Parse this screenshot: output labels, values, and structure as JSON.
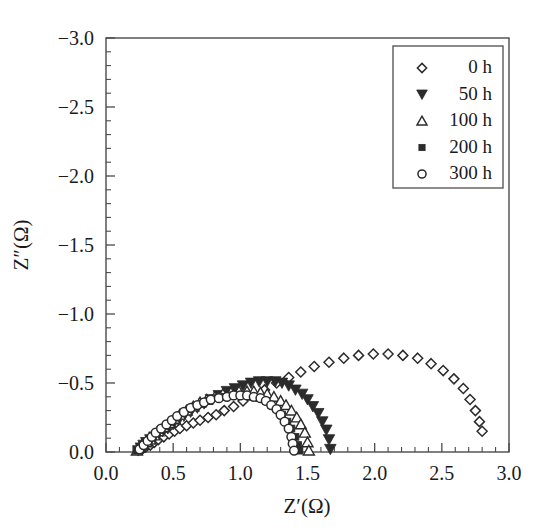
{
  "chart_data": {
    "type": "scatter",
    "title": "",
    "xlabel": "Z′(Ω)",
    "ylabel": "Z″(Ω)",
    "xlim": [
      0.0,
      3.0
    ],
    "ylim": [
      0.0,
      -3.0
    ],
    "x_ticks": [
      "0.0",
      "0.5",
      "1.0",
      "1.5",
      "2.0",
      "2.5",
      "3.0"
    ],
    "x_tick_values": [
      0.0,
      0.5,
      1.0,
      1.5,
      2.0,
      2.5,
      3.0
    ],
    "y_ticks": [
      "-3.0",
      "-2.5",
      "-2.0",
      "-1.5",
      "-1.0",
      "-0.5",
      "0.0"
    ],
    "y_tick_values": [
      -3.0,
      -2.5,
      -2.0,
      -1.5,
      -1.0,
      -0.5,
      0.0
    ],
    "minor_ticks_per_interval": 4,
    "grid": false,
    "legend_position": "top-right",
    "marker_color": "#2b2b2b",
    "series": [
      {
        "name": "0 h",
        "marker": "open-diamond",
        "x": [
          0.27,
          0.3,
          0.33,
          0.36,
          0.39,
          0.43,
          0.47,
          0.51,
          0.55,
          0.6,
          0.65,
          0.7,
          0.76,
          0.82,
          0.88,
          0.95,
          1.02,
          1.1,
          1.18,
          1.27,
          1.36,
          1.45,
          1.55,
          1.66,
          1.77,
          1.88,
          1.99,
          2.1,
          2.21,
          2.32,
          2.42,
          2.51,
          2.59,
          2.66,
          2.71,
          2.75,
          2.78,
          2.8
        ],
        "y": [
          -0.02,
          -0.04,
          -0.05,
          -0.07,
          -0.09,
          -0.11,
          -0.13,
          -0.15,
          -0.17,
          -0.19,
          -0.21,
          -0.23,
          -0.25,
          -0.27,
          -0.3,
          -0.33,
          -0.37,
          -0.41,
          -0.45,
          -0.5,
          -0.54,
          -0.58,
          -0.62,
          -0.65,
          -0.68,
          -0.7,
          -0.71,
          -0.71,
          -0.7,
          -0.68,
          -0.64,
          -0.59,
          -0.53,
          -0.46,
          -0.38,
          -0.3,
          -0.22,
          -0.15
        ]
      },
      {
        "name": "50 h",
        "marker": "filled-triangle-down",
        "x": [
          0.24,
          0.26,
          0.28,
          0.3,
          0.33,
          0.36,
          0.39,
          0.42,
          0.46,
          0.5,
          0.54,
          0.58,
          0.63,
          0.68,
          0.73,
          0.78,
          0.84,
          0.9,
          0.96,
          1.02,
          1.08,
          1.14,
          1.2,
          1.26,
          1.31,
          1.36,
          1.41,
          1.46,
          1.5,
          1.54,
          1.58,
          1.61,
          1.64,
          1.66,
          1.67
        ],
        "y": [
          -0.01,
          -0.03,
          -0.05,
          -0.07,
          -0.09,
          -0.11,
          -0.13,
          -0.15,
          -0.17,
          -0.2,
          -0.23,
          -0.26,
          -0.29,
          -0.32,
          -0.35,
          -0.38,
          -0.41,
          -0.44,
          -0.46,
          -0.48,
          -0.5,
          -0.51,
          -0.51,
          -0.51,
          -0.5,
          -0.48,
          -0.45,
          -0.42,
          -0.38,
          -0.33,
          -0.28,
          -0.22,
          -0.16,
          -0.09,
          -0.02
        ]
      },
      {
        "name": "100 h",
        "marker": "open-triangle-up",
        "x": [
          0.23,
          0.25,
          0.27,
          0.3,
          0.33,
          0.36,
          0.39,
          0.43,
          0.47,
          0.51,
          0.55,
          0.6,
          0.65,
          0.7,
          0.75,
          0.81,
          0.87,
          0.93,
          0.99,
          1.05,
          1.1,
          1.15,
          1.2,
          1.25,
          1.3,
          1.34,
          1.38,
          1.42,
          1.45,
          1.48,
          1.5,
          1.51
        ],
        "y": [
          -0.01,
          -0.03,
          -0.05,
          -0.07,
          -0.09,
          -0.12,
          -0.15,
          -0.18,
          -0.21,
          -0.24,
          -0.27,
          -0.3,
          -0.33,
          -0.36,
          -0.38,
          -0.4,
          -0.42,
          -0.43,
          -0.44,
          -0.44,
          -0.44,
          -0.43,
          -0.42,
          -0.4,
          -0.37,
          -0.34,
          -0.3,
          -0.25,
          -0.2,
          -0.14,
          -0.07,
          -0.01
        ]
      },
      {
        "name": "200 h",
        "marker": "filled-square",
        "x": [
          0.23,
          0.25,
          0.27,
          0.29,
          0.32,
          0.35,
          0.38,
          0.41,
          0.45,
          0.49,
          0.53,
          0.57,
          0.62,
          0.67,
          0.72,
          0.77,
          0.83,
          0.88,
          0.94,
          0.99,
          1.04,
          1.09,
          1.14,
          1.19,
          1.23,
          1.27,
          1.31,
          1.35,
          1.38,
          1.41,
          1.43,
          1.44
        ],
        "y": [
          -0.01,
          -0.03,
          -0.05,
          -0.07,
          -0.09,
          -0.11,
          -0.14,
          -0.16,
          -0.19,
          -0.22,
          -0.25,
          -0.28,
          -0.31,
          -0.33,
          -0.35,
          -0.37,
          -0.39,
          -0.4,
          -0.41,
          -0.41,
          -0.41,
          -0.4,
          -0.39,
          -0.37,
          -0.34,
          -0.31,
          -0.27,
          -0.22,
          -0.17,
          -0.11,
          -0.05,
          -0.01
        ]
      },
      {
        "name": "300 h",
        "marker": "open-circle",
        "x": [
          0.25,
          0.28,
          0.31,
          0.34,
          0.37,
          0.41,
          0.45,
          0.49,
          0.53,
          0.58,
          0.63,
          0.68,
          0.73,
          0.78,
          0.84,
          0.9,
          0.95,
          1.0,
          1.05,
          1.1,
          1.15,
          1.19,
          1.23,
          1.27,
          1.3,
          1.33,
          1.36,
          1.38,
          1.39,
          1.4
        ],
        "y": [
          -0.02,
          -0.05,
          -0.08,
          -0.11,
          -0.14,
          -0.17,
          -0.2,
          -0.23,
          -0.26,
          -0.29,
          -0.32,
          -0.34,
          -0.36,
          -0.38,
          -0.39,
          -0.4,
          -0.41,
          -0.41,
          -0.41,
          -0.4,
          -0.39,
          -0.37,
          -0.34,
          -0.31,
          -0.27,
          -0.22,
          -0.17,
          -0.11,
          -0.06,
          -0.01
        ]
      }
    ]
  },
  "legend": {
    "items": [
      {
        "label": "0 h",
        "marker": "open-diamond"
      },
      {
        "label": "50 h",
        "marker": "filled-triangle-down"
      },
      {
        "label": "100 h",
        "marker": "open-triangle-up"
      },
      {
        "label": "200 h",
        "marker": "filled-square"
      },
      {
        "label": "300 h",
        "marker": "open-circle"
      }
    ]
  },
  "axes": {
    "x_title": "Z′(Ω)",
    "y_title": "Z″(Ω)",
    "x_tick_labels": [
      "0.0",
      "0.5",
      "1.0",
      "1.5",
      "2.0",
      "2.5",
      "3.0"
    ],
    "y_tick_labels": [
      "-3.0",
      "-2.5",
      "-2.0",
      "-1.5",
      "-1.0",
      "-0.5",
      "0.0"
    ]
  }
}
